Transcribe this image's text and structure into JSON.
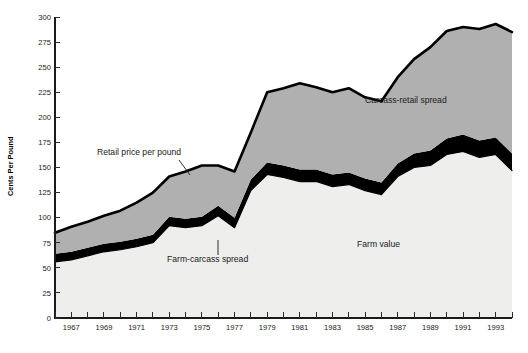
{
  "chart_data": {
    "type": "area",
    "title": "",
    "subtitle": "",
    "xlabel": "",
    "ylabel": "Cents Per Pound",
    "ylim": [
      0,
      300
    ],
    "xlim": [
      1966,
      1994
    ],
    "ytick_step": 25,
    "yticks": [
      "0",
      "25",
      "50",
      "75",
      "100",
      "125",
      "150",
      "175",
      "200",
      "225",
      "250",
      "275",
      "300"
    ],
    "xticks": [
      "1966",
      "1967",
      "1968",
      "1969",
      "1970",
      "1971",
      "1972",
      "1973",
      "1974",
      "1975",
      "1976",
      "1977",
      "1978",
      "1979",
      "1980",
      "1981",
      "1982",
      "1983",
      "1984",
      "1985",
      "1986",
      "1987",
      "1988",
      "1989",
      "1990",
      "1991",
      "1992",
      "1993",
      "1994"
    ],
    "xtick_labels_shown": [
      "1967",
      "1969",
      "1971",
      "1973",
      "1975",
      "1977",
      "1979",
      "1981",
      "1983",
      "1985",
      "1987",
      "1989",
      "1991",
      "1993"
    ],
    "grid": "horizontal-faint-at-25",
    "legend_position": "inline-annotations",
    "stacked": true,
    "x": [
      1966,
      1967,
      1968,
      1969,
      1970,
      1971,
      1972,
      1973,
      1974,
      1975,
      1976,
      1977,
      1978,
      1979,
      1980,
      1981,
      1982,
      1983,
      1984,
      1985,
      1986,
      1987,
      1988,
      1989,
      1990,
      1991,
      1992,
      1993,
      1994
    ],
    "series": [
      {
        "name": "Farm value",
        "color": "#eeeeec",
        "values": [
          56,
          58,
          62,
          66,
          68,
          71,
          75,
          92,
          90,
          92,
          102,
          90,
          127,
          143,
          140,
          136,
          136,
          131,
          133,
          127,
          123,
          141,
          150,
          152,
          163,
          166,
          160,
          163,
          147
        ]
      },
      {
        "name": "Farm-carcass spread",
        "color": "#000000",
        "values": [
          8,
          8,
          8,
          8,
          8,
          8,
          8,
          9,
          9,
          9,
          10,
          10,
          11,
          12,
          12,
          12,
          12,
          12,
          12,
          12,
          12,
          13,
          14,
          15,
          16,
          17,
          17,
          17,
          17
        ]
      },
      {
        "name": "Carcass-retail spread",
        "color": "#b0b0b0",
        "values": [
          21,
          25,
          26,
          28,
          31,
          36,
          42,
          40,
          47,
          51,
          40,
          46,
          47,
          70,
          77,
          86,
          82,
          82,
          84,
          81,
          81,
          86,
          94,
          103,
          107,
          107,
          111,
          113,
          121
        ]
      }
    ],
    "total_series": {
      "name": "Retail price per pound",
      "values": [
        85,
        91,
        96,
        102,
        107,
        115,
        125,
        141,
        146,
        152,
        152,
        146,
        185,
        225,
        229,
        234,
        230,
        225,
        229,
        220,
        216,
        240,
        258,
        270,
        286,
        290,
        288,
        293,
        285
      ]
    },
    "annotations": [
      {
        "name": "retail-price-label",
        "text": "Retail price per pound",
        "x": 97,
        "y": 155
      },
      {
        "name": "farm-carcass-label",
        "text": "Farm-carcass spread",
        "x": 167,
        "y": 262
      },
      {
        "name": "farm-value-label",
        "text": "Farm value",
        "x": 357,
        "y": 247
      },
      {
        "name": "carcass-retail-label",
        "text": "Carcass-retail spread",
        "x": 365,
        "y": 103
      }
    ]
  }
}
